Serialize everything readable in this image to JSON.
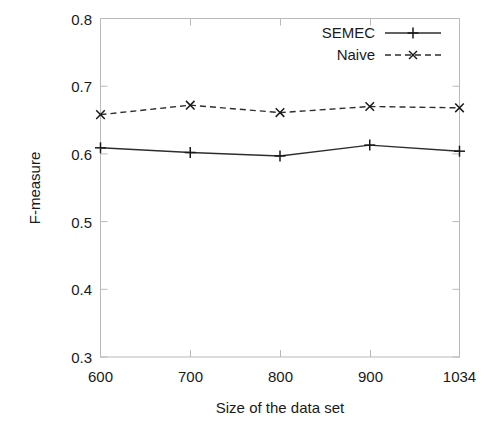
{
  "chart_data": {
    "type": "line",
    "title": "",
    "xlabel": "Size of the data set",
    "ylabel": "F-measure",
    "categories": [
      "600",
      "700",
      "800",
      "900",
      "1034"
    ],
    "x_tick_labels": [
      "600",
      "700",
      "800",
      "900",
      "1034"
    ],
    "y_tick_labels": [
      "0.3",
      "0.4",
      "0.5",
      "0.6",
      "0.7",
      "0.8"
    ],
    "y_ticks": [
      0.3,
      0.4,
      0.5,
      0.6,
      0.7,
      0.8
    ],
    "ylim": [
      0.3,
      0.8
    ],
    "grid": false,
    "legend_position": "top-right",
    "series": [
      {
        "name": "SEMEC",
        "marker": "plus",
        "linestyle": "solid",
        "color": "#2e2e2e",
        "values": [
          0.609,
          0.602,
          0.597,
          0.613,
          0.604
        ]
      },
      {
        "name": "Naive",
        "marker": "cross",
        "linestyle": "dashed",
        "color": "#2e2e2e",
        "values": [
          0.658,
          0.672,
          0.661,
          0.67,
          0.668
        ]
      }
    ]
  },
  "figure": {
    "background_color": "#ffffff",
    "frame_color": "#b9b9b9",
    "ink_color": "#1a1a1a"
  },
  "legend": {
    "entries": [
      {
        "label": "SEMEC",
        "marker": "plus-icon",
        "linestyle": "solid"
      },
      {
        "label": "Naive",
        "marker": "cross-icon",
        "linestyle": "dashed"
      }
    ]
  }
}
